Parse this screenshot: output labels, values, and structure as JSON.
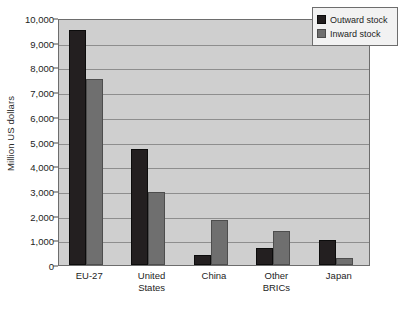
{
  "chart_data": {
    "type": "bar",
    "title": "",
    "xlabel": "",
    "ylabel": "Million US dollars",
    "ylim": [
      0,
      10000
    ],
    "ytick_labels": [
      "10,000",
      "9,000",
      "8,000",
      "7,000",
      "6,000",
      "5,000",
      "4,000",
      "3,000",
      "2,000",
      "1,000",
      "0"
    ],
    "ytick_values": [
      10000,
      9000,
      8000,
      7000,
      6000,
      5000,
      4000,
      3000,
      2000,
      1000,
      0
    ],
    "grid": true,
    "legend_position": "top-right",
    "categories": [
      "EU-27",
      "United States",
      "China",
      "Other BRICs",
      "Japan"
    ],
    "category_lines": [
      [
        "EU-27"
      ],
      [
        "United",
        "States"
      ],
      [
        "China"
      ],
      [
        "Other",
        "BRICs"
      ],
      [
        "Japan"
      ]
    ],
    "series": [
      {
        "name": "Outward stock",
        "color": "#231f20",
        "values": [
          9500,
          4700,
          400,
          700,
          1010
        ]
      },
      {
        "name": "Inward stock",
        "color": "#6f6f6f",
        "values": [
          7520,
          2940,
          1820,
          1370,
          270
        ]
      }
    ]
  },
  "legend": {
    "items": [
      {
        "label": "Outward stock",
        "swatch": "outward"
      },
      {
        "label": "Inward stock",
        "swatch": "inward"
      }
    ]
  },
  "colors": {
    "plot_background": "#cfcfcf",
    "gridline": "#8e8e8e",
    "axis": "#6d6d6d",
    "outward": "#231f20",
    "inward": "#6f6f6f",
    "legend_background": "#f2f2f2"
  }
}
